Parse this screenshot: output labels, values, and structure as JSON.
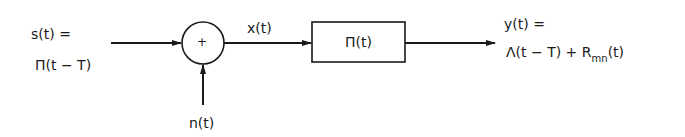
{
  "input": {
    "line1": "s(t) =",
    "line2": "Π(t − T)"
  },
  "summer": {
    "symbol": "+"
  },
  "noise": {
    "label": "n(t)"
  },
  "intermediate": {
    "label": "x(t)"
  },
  "filter": {
    "label": "Π(t)"
  },
  "output": {
    "line1": "y(t) =",
    "line2_main": "Λ(t − T) + R",
    "line2_sub": "mn",
    "line2_tail": "(t)"
  },
  "colors": {
    "stroke": "#1a1a1a",
    "background": "#ffffff"
  }
}
